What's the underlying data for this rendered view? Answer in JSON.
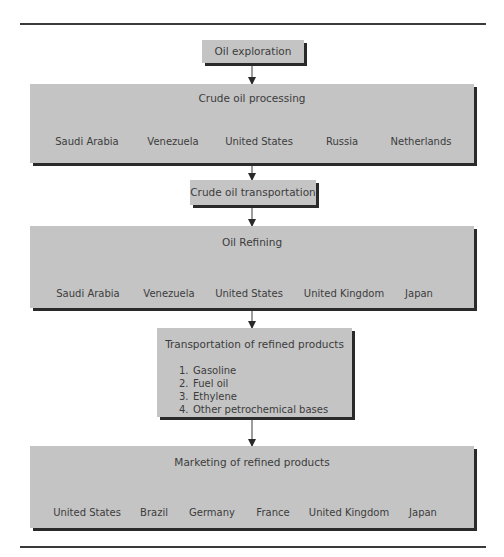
{
  "diagram": {
    "stages": [
      {
        "id": "oil-exploration",
        "label": "Oil exploration"
      },
      {
        "id": "crude-oil-processing",
        "label": "Crude oil processing",
        "countries": [
          "Saudi Arabia",
          "Venezuela",
          "United States",
          "Russia",
          "Netherlands"
        ]
      },
      {
        "id": "crude-oil-transportation",
        "label": "Crude oil transportation"
      },
      {
        "id": "oil-refining",
        "label": "Oil Refining",
        "countries": [
          "Saudi Arabia",
          "Venezuela",
          "United States",
          "United Kingdom",
          "Japan"
        ]
      },
      {
        "id": "transportation-of-refined-products",
        "label": "Transportation of refined products",
        "items": [
          {
            "num": "1.",
            "text": "Gasoline"
          },
          {
            "num": "2.",
            "text": "Fuel oil"
          },
          {
            "num": "3.",
            "text": "Ethylene"
          },
          {
            "num": "4.",
            "text": "Other petrochemical bases"
          }
        ]
      },
      {
        "id": "marketing-of-refined-products",
        "label": "Marketing of refined products",
        "countries": [
          "United States",
          "Brazil",
          "Germany",
          "France",
          "United Kingdom",
          "Japan"
        ]
      }
    ],
    "colors": {
      "box_fill": "#c4c4c4",
      "shadow": "#2a2a2a",
      "line": "#3a3a3a",
      "text": "#3c3c3c"
    }
  }
}
